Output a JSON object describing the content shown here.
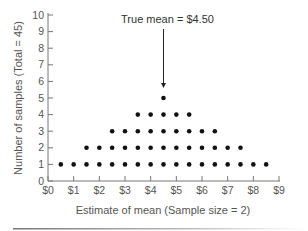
{
  "chart_data": {
    "type": "scatter",
    "subtype": "dot-plot",
    "title": "",
    "xlabel": "Estimate of mean (Sample size = 2)",
    "ylabel": "Number of samples (Total = 45)",
    "xlim": [
      0,
      9
    ],
    "ylim": [
      0,
      10
    ],
    "x_ticks": [
      0,
      1,
      2,
      3,
      4,
      5,
      6,
      7,
      8,
      9
    ],
    "x_tick_labels": [
      "$0",
      "$1",
      "$2",
      "$3",
      "$4",
      "$5",
      "$6",
      "$7",
      "$8",
      "$9"
    ],
    "y_ticks": [
      0,
      1,
      2,
      3,
      4,
      5,
      6,
      7,
      8,
      9,
      10
    ],
    "y_tick_labels": [
      "0",
      "1",
      "2",
      "3",
      "4",
      "5",
      "6",
      "7",
      "8",
      "9",
      "10"
    ],
    "grid": false,
    "legend": null,
    "categories": [
      0.5,
      1.0,
      1.5,
      2.0,
      2.5,
      3.0,
      3.5,
      4.0,
      4.5,
      5.0,
      5.5,
      6.0,
      6.5,
      7.0,
      7.5,
      8.0,
      8.5
    ],
    "values": [
      1,
      1,
      2,
      2,
      3,
      3,
      4,
      4,
      5,
      4,
      4,
      3,
      3,
      2,
      2,
      1,
      1
    ],
    "total": 45,
    "annotations": [
      {
        "text": "True mean = $4.50",
        "x": 4.5,
        "arrow_to_y": 5.6
      }
    ],
    "dot_color": "#111111",
    "axis_color": "#777777"
  }
}
